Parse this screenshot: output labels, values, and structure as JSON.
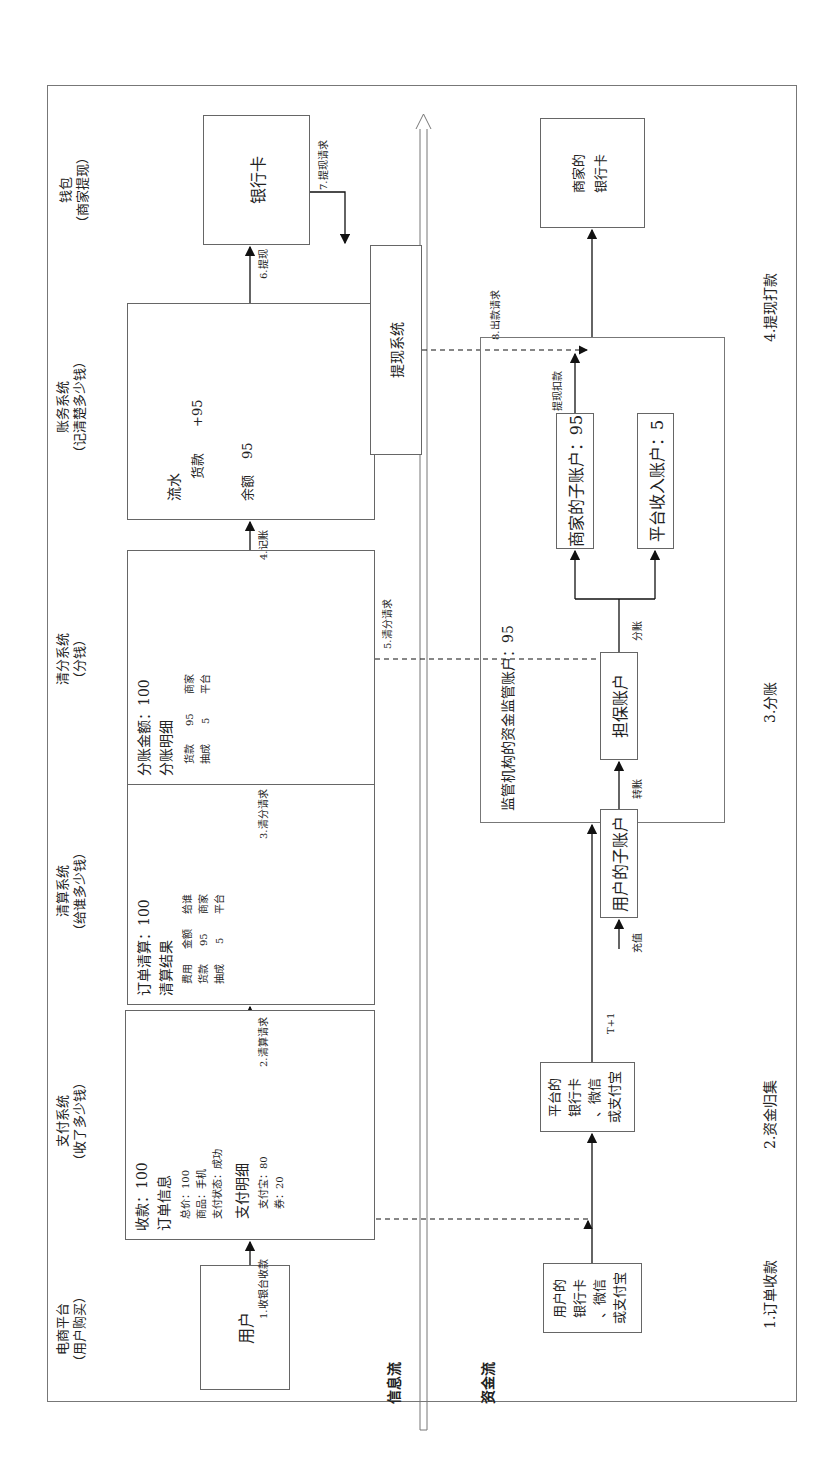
{
  "flows": {
    "info_flow_label": "信息流",
    "money_flow_label": "资金流"
  },
  "columns": [
    {
      "title": "电商平台",
      "subtitle": "（用户购买）"
    },
    {
      "title": "支付系统",
      "subtitle": "（收了多少钱）"
    },
    {
      "title": "清算系统",
      "subtitle": "（给谁多少钱）"
    },
    {
      "title": "清分系统",
      "subtitle": "（分钱）"
    },
    {
      "title": "账务系统",
      "subtitle": "（记清楚多少钱）"
    },
    {
      "title": "钱包",
      "subtitle": "（商家提现）"
    }
  ],
  "info_boxes": {
    "user": "用户",
    "payment": {
      "receipt": "收款：100",
      "order_info": "订单信息",
      "total": "总价：100",
      "product": "商品：手机",
      "status": "支付状态：成功",
      "pay_detail": "支付明细",
      "alipay": "支付宝：80",
      "coupon": "券：20"
    },
    "clearing": {
      "order_clearing": "订单清算：100",
      "result": "清算结果",
      "headers": [
        "费用",
        "金额",
        "给谁"
      ],
      "rows": [
        [
          "货款",
          "95",
          "商家"
        ],
        [
          "抽成",
          "5",
          "平台"
        ]
      ]
    },
    "splitting": {
      "amount": "分账金额：100",
      "detail": "分账明细",
      "rows": [
        [
          "货款",
          "95",
          "商家"
        ],
        [
          "抽成",
          "5",
          "平台"
        ]
      ]
    },
    "accounting": {
      "ledger": "流水",
      "entry_label": "货款",
      "entry_value": "+95",
      "balance_label": "余额",
      "balance_value": "95"
    },
    "bank_card": "银行卡",
    "withdraw_system": "提现系统"
  },
  "info_arrows": {
    "a1": "1.收银台收款",
    "a2": "2.清算请求",
    "a3": "3.清分请求",
    "a4": "4.记账",
    "a5": "5.清分请求",
    "a6": "6.提现",
    "a7": "7.提现请求",
    "a8": "8.出款请求"
  },
  "money_boxes": {
    "user_bank": [
      "用户的",
      "银行卡",
      "、微信",
      "或支付宝"
    ],
    "platform_bank": [
      "平台的",
      "银行卡",
      "、微信",
      "或支付宝"
    ],
    "custody_title": "监管机构的资金监管账户：95",
    "user_sub_account": "用户的子账户",
    "escrow_account": "担保账户",
    "merchant_sub_account": "商家的子账户：95",
    "platform_income_account": "平台收入账户：5",
    "merchant_bank": [
      "商家的",
      "银行卡"
    ]
  },
  "money_arrows": {
    "t1": "T+1",
    "recharge": "充值",
    "transfer": "转账",
    "split": "分账",
    "withdraw_deduct": "提现扣款"
  },
  "stages": [
    "1.订单收款",
    "2.资金归集",
    "3.分账",
    "4.提现打款"
  ]
}
